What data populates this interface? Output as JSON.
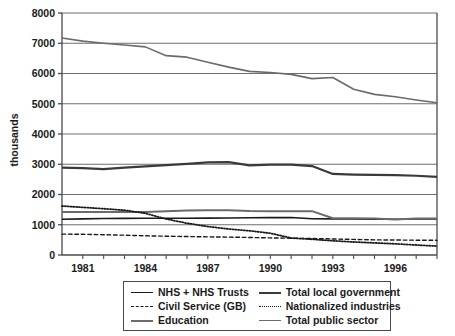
{
  "chart_data": {
    "type": "line",
    "title": "",
    "xlabel": "",
    "ylabel": "thousands",
    "xlim": [
      1980,
      1998
    ],
    "ylim": [
      0,
      8000
    ],
    "grid": true,
    "legend_position": "bottom",
    "x": [
      1980,
      1981,
      1982,
      1983,
      1984,
      1985,
      1986,
      1987,
      1988,
      1989,
      1990,
      1991,
      1992,
      1993,
      1994,
      1995,
      1996,
      1997,
      1998
    ],
    "xticks": [
      1981,
      1984,
      1987,
      1990,
      1993,
      1996
    ],
    "xtick_labels": [
      "1981",
      "1984",
      "1987",
      "1990",
      "1993",
      "1996"
    ],
    "yticks": [
      0,
      1000,
      2000,
      3000,
      4000,
      5000,
      6000,
      7000,
      8000
    ],
    "ytick_labels": [
      "0",
      "1000",
      "2000",
      "3000",
      "4000",
      "5000",
      "6000",
      "7000",
      "8000"
    ],
    "series": [
      {
        "name": "NHS + NHS Trusts",
        "color": "#1a1a1a",
        "style": "solid",
        "width": 1.6,
        "values": [
          1180,
          1195,
          1205,
          1210,
          1215,
          1215,
          1215,
          1220,
          1225,
          1230,
          1235,
          1240,
          1200,
          1195,
          1190,
          1185,
          1180,
          1190,
          1195
        ]
      },
      {
        "name": "Civil Service (GB)",
        "color": "#1a1a1a",
        "style": "dashed",
        "width": 1.4,
        "values": [
          690,
          685,
          670,
          655,
          635,
          620,
          610,
          600,
          590,
          580,
          565,
          555,
          545,
          530,
          515,
          500,
          495,
          490,
          485
        ]
      },
      {
        "name": "Education",
        "color": "#6b6b6b",
        "style": "solid",
        "width": 2.0,
        "values": [
          1420,
          1425,
          1420,
          1420,
          1425,
          1450,
          1470,
          1480,
          1480,
          1455,
          1450,
          1450,
          1450,
          1215,
          1215,
          1210,
          1175,
          1205,
          1210
        ]
      },
      {
        "name": "Total local government",
        "color": "#3a3a3a",
        "style": "solid",
        "width": 2.2,
        "values": [
          2890,
          2870,
          2840,
          2890,
          2930,
          2970,
          3010,
          3060,
          3070,
          2960,
          2990,
          2985,
          2940,
          2680,
          2660,
          2650,
          2640,
          2620,
          2585
        ]
      },
      {
        "name": "Nationalized industries",
        "color": "#1a1a1a",
        "style": "dotted",
        "width": 1.8,
        "values": [
          1620,
          1575,
          1530,
          1480,
          1380,
          1190,
          1050,
          940,
          860,
          800,
          720,
          560,
          520,
          470,
          430,
          400,
          370,
          330,
          295
        ]
      },
      {
        "name": "Total public sector",
        "color": "#6b6b6b",
        "style": "solid",
        "width": 1.6,
        "values": [
          7175,
          7070,
          7000,
          6940,
          6880,
          6590,
          6540,
          6370,
          6210,
          6070,
          6035,
          5970,
          5830,
          5870,
          5480,
          5310,
          5230,
          5125,
          5035
        ]
      }
    ]
  },
  "legend": {
    "items": [
      {
        "label": "NHS + NHS Trusts",
        "swatch": "solid-line-black-swatch"
      },
      {
        "label": "Total local government",
        "swatch": "solid-line-darkgray-swatch"
      },
      {
        "label": "Civil Service (GB)",
        "swatch": "dashed-line-black-swatch"
      },
      {
        "label": "Nationalized industries",
        "swatch": "dotted-line-gray-swatch"
      },
      {
        "label": "Education",
        "swatch": "solid-line-gray-swatch"
      },
      {
        "label": "Total public sector",
        "swatch": "solid-line-lightgray-swatch"
      }
    ]
  },
  "colors": {
    "axis": "#4a4a4a",
    "grid": "#6e6e6e",
    "text": "#1a1a1a",
    "background": "#ffffff"
  }
}
